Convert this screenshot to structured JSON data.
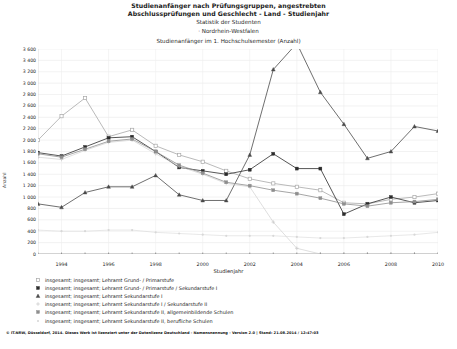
{
  "titles": {
    "line1": "Studienanfänger nach Prüfungsgruppen, angestrebten",
    "line2": "Abschlussprüfungen und Geschlecht - Land - Studienjahr",
    "line3": "Statistik der Studenten",
    "line4": "· Nordrhein-Westfalen",
    "line5": "Studienanfänger im 1. Hochschulsemester (Anzahl)"
  },
  "footer": {
    "text": "© IT.NRW, Düsseldorf, 2014. Dieses Werk ist lizenziert unter der Datenlizenz Deutschland - Namensnennung - Version 2.0 | Stand: 21.08.2014 / 12:47:03"
  },
  "chart_data": {
    "type": "line",
    "title": "Studienanfänger nach Prüfungsgruppen, angestrebten Abschlussprüfungen und Geschlecht - Land - Studienjahr",
    "xlabel": "Studienjahr",
    "ylabel": "Anzahl",
    "xlim": [
      1993,
      2010
    ],
    "ylim": [
      0,
      3600
    ],
    "ytick_step": 200,
    "grid": true,
    "legend_position": "below",
    "x": [
      1993,
      1994,
      1995,
      1996,
      1997,
      1998,
      1999,
      2000,
      2001,
      2002,
      2003,
      2004,
      2005,
      2006,
      2007,
      2008,
      2009,
      2010
    ],
    "xtick_labels": [
      "1994",
      "1996",
      "1998",
      "2000",
      "2002",
      "2004",
      "2006",
      "2008",
      "2010"
    ],
    "xtick_values": [
      1994,
      1996,
      1998,
      2000,
      2002,
      2004,
      2006,
      2008,
      2010
    ],
    "ytick_labels": [
      "0",
      "200",
      "400",
      "600",
      "800",
      "1 000",
      "1 200",
      "1 400",
      "1 600",
      "1 800",
      "2 000",
      "2 200",
      "2 400",
      "2 600",
      "2 800",
      "3 000",
      "3 200",
      "3 400",
      "3 600"
    ],
    "series": [
      {
        "name": "insgesamt; insgesamt; Lehramt Grund- / Primarstufe",
        "marker": "square-open",
        "color": "#a8a8a8",
        "values": [
          2000,
          2420,
          2740,
          2060,
          2180,
          1900,
          1740,
          1620,
          1460,
          1320,
          1240,
          1180,
          1120,
          900,
          880,
          960,
          1000,
          1060
        ]
      },
      {
        "name": "insgesamt; insgesamt; Lehramt Grund- / Primarstufe / Sekundarstufe I",
        "marker": "square-filled",
        "color": "#2b2b2b",
        "values": [
          1780,
          1720,
          1880,
          2040,
          2060,
          1800,
          1520,
          1460,
          1400,
          1480,
          1760,
          1500,
          1500,
          700,
          880,
          1000,
          900,
          940
        ]
      },
      {
        "name": "insgesamt; insgesamt; Lehramt Sekundarstufe I",
        "marker": "triangle-filled",
        "color": "#4a4a4a",
        "values": [
          880,
          820,
          1080,
          1180,
          1180,
          1380,
          1040,
          940,
          940,
          1740,
          3240,
          3700,
          2840,
          2280,
          1680,
          1800,
          2240,
          2160
        ]
      },
      {
        "name": "insgesamt; insgesamt; Lehramt Sekundarstufe I / Sekundarstufe II",
        "marker": "plus",
        "color": "#c9c9c9",
        "values": [
          1700,
          1660,
          1820,
          1960,
          2000,
          1760,
          1540,
          1400,
          1240,
          1180,
          560,
          100,
          0,
          0,
          0,
          0,
          0,
          0
        ]
      },
      {
        "name": "insgesamt; insgesamt; Lehramt Sekundarstufe II, allgemeinbildende Schulen",
        "marker": "square-grey",
        "color": "#8e8e8e",
        "values": [
          1760,
          1700,
          1840,
          1980,
          2020,
          1800,
          1560,
          1420,
          1260,
          1200,
          1120,
          1060,
          980,
          880,
          840,
          900,
          920,
          960
        ]
      },
      {
        "name": "insgesamt; insgesamt; Lehramt Sekundarstufe II, berufliche Schulen",
        "marker": "dot-light",
        "color": "#d8d8d8",
        "values": [
          420,
          400,
          400,
          420,
          420,
          380,
          360,
          340,
          320,
          320,
          320,
          300,
          280,
          280,
          300,
          320,
          340,
          380
        ]
      }
    ]
  },
  "legend": {
    "items": [
      "insgesamt; insgesamt; Lehramt Grund- / Primarstufe",
      "insgesamt; insgesamt; Lehramt Grund- / Primarstufe / Sekundarstufe I",
      "insgesamt; insgesamt; Lehramt Sekundarstufe I",
      "insgesamt; insgesamt; Lehramt Sekundarstufe I / Sekundarstufe II",
      "insgesamt; insgesamt; Lehramt Sekundarstufe II, allgemeinbildende Schulen",
      "insgesamt; insgesamt; Lehramt Sekundarstufe II, berufliche Schulen"
    ]
  }
}
